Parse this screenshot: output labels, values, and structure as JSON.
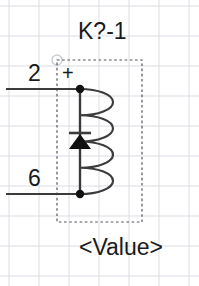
{
  "canvas": {
    "width": 199,
    "height": 286,
    "background": "#ffffff"
  },
  "grid": {
    "line_color": "#d9dde3",
    "spacing": 30,
    "x_positions": [
      9,
      39,
      69,
      99,
      129,
      159,
      189
    ],
    "y_positions": [
      6,
      36,
      66,
      96,
      126,
      156,
      186,
      216,
      246,
      276
    ]
  },
  "symbol": {
    "type": "relay-coil-with-flyback-diode",
    "designator": "K?-1",
    "value": "<Value>",
    "polarity_marker": "+",
    "stroke_color": "#3c3c3c",
    "fill_color": "#111111",
    "anchor_marker_color": "#c8cdd4",
    "bounding_box": {
      "label": "component-outline",
      "x": 57,
      "y": 60,
      "width": 85,
      "height": 162,
      "style": "dashed",
      "color": "#555555"
    },
    "coil": {
      "label": "coil-winding",
      "arc_count": 4,
      "spine_x": 80,
      "top_y": 89,
      "bottom_y": 194,
      "bulge_right_x": 113
    },
    "diode": {
      "label": "flyback-diode",
      "orientation": "anode-bottom-cathode-top",
      "center_x": 80,
      "cathode_bar_y": 133,
      "cathode_bar_half_width": 11,
      "triangle_top_y": 134,
      "triangle_bottom_y": 149,
      "triangle_half_width": 11
    },
    "nodes": [
      {
        "label": "junction-dot-top",
        "x": 80,
        "y": 89,
        "radius": 4.2
      },
      {
        "label": "junction-dot-bottom",
        "x": 80,
        "y": 194,
        "radius": 4.2
      }
    ],
    "pins": [
      {
        "number": "2",
        "label_x": 28,
        "label_y": 62,
        "wire_y": 89,
        "wire_x_start": 6,
        "wire_x_end": 80
      },
      {
        "number": "6",
        "label_x": 28,
        "label_y": 167,
        "wire_y": 194,
        "wire_x_start": 6,
        "wire_x_end": 80
      }
    ],
    "anchor": {
      "label": "origin-anchor",
      "x": 57,
      "y": 60,
      "radius": 5
    }
  }
}
